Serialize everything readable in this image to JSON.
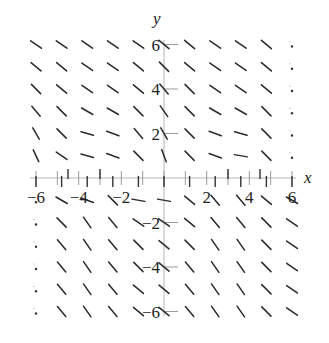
{
  "chart_data": {
    "type": "slope_field",
    "title": "",
    "xlabel": "x",
    "ylabel": "y",
    "xlim": [
      -6,
      6
    ],
    "ylim": [
      -6,
      6
    ],
    "grid": false,
    "x_ticks": [
      -6,
      -5,
      -4,
      -3,
      -2,
      -1,
      0,
      1,
      2,
      3,
      4,
      5,
      6
    ],
    "x_tick_labels": [
      "-6",
      "-4",
      "-2",
      "2",
      "4",
      "6"
    ],
    "x_tick_label_values": [
      -6,
      -4,
      -2,
      2,
      4,
      6
    ],
    "y_ticks": [
      -6,
      -4,
      -2,
      2,
      4,
      6
    ],
    "y_tick_labels": [
      "-6",
      "-4",
      "-2",
      "2",
      "4",
      "6"
    ],
    "sample_x": [
      -6.0,
      -4.8,
      -3.6,
      -2.4,
      -1.2,
      0.0,
      1.2,
      2.4,
      3.6,
      4.8,
      6.0
    ],
    "sample_y": [
      6,
      5,
      4,
      3,
      2,
      1,
      0,
      -1,
      -2,
      -3,
      -4,
      -5,
      -6
    ],
    "segment_angles_deg_rows": [
      [
        -35,
        -35,
        -35,
        -35,
        -35,
        -40,
        -40,
        -35,
        -35,
        -40,
        null
      ],
      [
        -40,
        -40,
        -35,
        -35,
        -40,
        -45,
        -40,
        -35,
        -35,
        -40,
        null
      ],
      [
        -45,
        -40,
        -35,
        -35,
        -40,
        -50,
        -45,
        -35,
        -35,
        -40,
        null
      ],
      [
        -50,
        -45,
        -30,
        -30,
        -45,
        -55,
        -45,
        -30,
        -30,
        -45,
        null
      ],
      [
        -60,
        -45,
        -15,
        -20,
        -50,
        -60,
        -45,
        -20,
        -15,
        -45,
        null
      ],
      [
        -65,
        -35,
        -15,
        -20,
        -45,
        -70,
        -45,
        -20,
        -10,
        -45,
        null
      ],
      [
        -90,
        -90,
        -90,
        -90,
        -90,
        -90,
        -90,
        -90,
        -90,
        -90,
        -90
      ],
      [
        null,
        -30,
        -20,
        -45,
        -10,
        -10,
        -40,
        -50,
        -50,
        -40,
        -30
      ],
      [
        null,
        -45,
        -55,
        -50,
        -35,
        -35,
        -40,
        -50,
        -50,
        -45,
        -35
      ],
      [
        null,
        -50,
        -55,
        -50,
        -45,
        -40,
        -45,
        -55,
        -55,
        -45,
        -35
      ],
      [
        null,
        -50,
        -55,
        -50,
        -45,
        -40,
        -50,
        -55,
        -55,
        -45,
        -35
      ],
      [
        null,
        -50,
        -55,
        -50,
        -40,
        -40,
        -50,
        -55,
        -55,
        -45,
        -35
      ],
      [
        null,
        -50,
        -55,
        -50,
        -40,
        -40,
        -50,
        -55,
        -55,
        -45,
        -35
      ]
    ],
    "x_axis_markers_above": [
      -4.5,
      -3,
      3,
      4.5
    ]
  }
}
